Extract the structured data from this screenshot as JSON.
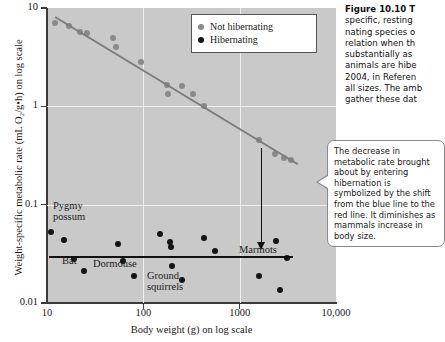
{
  "chart_data": {
    "type": "scatter",
    "title": "",
    "xlabel": "Body weight (g) on log scale",
    "ylabel": "Weight-specific metabolic rate (mL O₂/g•h) on log scale",
    "xscale": "log",
    "yscale": "log",
    "xlim": [
      10,
      10000
    ],
    "ylim": [
      0.01,
      10
    ],
    "xticks": [
      "10",
      "100",
      "1000",
      "10,000"
    ],
    "yticks": [
      "10",
      "1",
      "0.1",
      "0.01"
    ],
    "grid": true,
    "legend_position": "top-right",
    "series": [
      {
        "name": "Not hibernating",
        "color": "#8a8a8a",
        "points": [
          {
            "x": 12,
            "y": 7.0
          },
          {
            "x": 17,
            "y": 6.6
          },
          {
            "x": 22,
            "y": 5.7
          },
          {
            "x": 26,
            "y": 5.6
          },
          {
            "x": 48,
            "y": 5.0
          },
          {
            "x": 52,
            "y": 4.0
          },
          {
            "x": 95,
            "y": 2.8
          },
          {
            "x": 175,
            "y": 1.65
          },
          {
            "x": 180,
            "y": 1.35
          },
          {
            "x": 255,
            "y": 1.6
          },
          {
            "x": 330,
            "y": 1.35
          },
          {
            "x": 430,
            "y": 1.0
          },
          {
            "x": 1600,
            "y": 0.45
          },
          {
            "x": 2300,
            "y": 0.33
          },
          {
            "x": 2900,
            "y": 0.3
          },
          {
            "x": 3400,
            "y": 0.285
          }
        ]
      },
      {
        "name": "Hibernating",
        "color": "#141414",
        "points": [
          {
            "x": 11,
            "y": 0.053
          },
          {
            "x": 15,
            "y": 0.044
          },
          {
            "x": 19,
            "y": 0.028
          },
          {
            "x": 24,
            "y": 0.021
          },
          {
            "x": 55,
            "y": 0.04
          },
          {
            "x": 62,
            "y": 0.027
          },
          {
            "x": 80,
            "y": 0.019
          },
          {
            "x": 150,
            "y": 0.05
          },
          {
            "x": 190,
            "y": 0.042
          },
          {
            "x": 193,
            "y": 0.037
          },
          {
            "x": 200,
            "y": 0.024
          },
          {
            "x": 250,
            "y": 0.017
          },
          {
            "x": 430,
            "y": 0.046
          },
          {
            "x": 560,
            "y": 0.034
          },
          {
            "x": 1600,
            "y": 0.019
          },
          {
            "x": 2400,
            "y": 0.043
          },
          {
            "x": 3100,
            "y": 0.029
          },
          {
            "x": 2600,
            "y": 0.0135
          }
        ]
      }
    ],
    "trendlines": [
      {
        "name": "not-hibernating-regression",
        "color": "#7c7c7c",
        "from": {
          "x": 12,
          "y": 8.2
        },
        "to": {
          "x": 4000,
          "y": 0.26
        }
      },
      {
        "name": "hibernating-regression",
        "color": "#111111",
        "from": {
          "x": 10.5,
          "y": 0.03
        },
        "to": {
          "x": 3600,
          "y": 0.03
        }
      }
    ],
    "annotations": [
      {
        "label": "Pygmy possum",
        "species": "pygmy-possum"
      },
      {
        "label": "Bat",
        "species": "bat"
      },
      {
        "label": "Dormouse",
        "species": "dormouse"
      },
      {
        "label": "Ground squirrels",
        "species": "ground-squirrels"
      },
      {
        "label": "Marmots",
        "species": "marmots"
      }
    ]
  },
  "legend": {
    "items": [
      {
        "label": "Not hibernating",
        "color": "#8a8a8a"
      },
      {
        "label": "Hibernating",
        "color": "#141414"
      }
    ]
  },
  "axis": {
    "y_title": "Weight-specific metabolic rate (mL O₂/g•h) on log scale",
    "x_title": "Body weight (g) on log scale",
    "y_ticks": [
      "10",
      "1",
      "0.1",
      "0.01"
    ],
    "x_ticks": [
      "10",
      "100",
      "1000",
      "10,000"
    ]
  },
  "species_labels": {
    "pygmy_possum_line1": "Pygmy",
    "pygmy_possum_line2": "possum",
    "bat": "Bat",
    "dormouse": "Dormouse",
    "ground_squirrels_line1": "Ground",
    "ground_squirrels_line2": "squirrels",
    "marmots": "Marmots"
  },
  "callout": {
    "text": "The decrease in metabolic rate brought about by entering hibernation is symbolized by the shift from the blue line to the red line. It diminishes as mammals increase in body size."
  },
  "caption": {
    "title": "Figure 10.10  T",
    "lines": [
      "specific, resting ",
      "nating species o",
      "relation when th",
      "substantially as ",
      "animals are hibe",
      "2004, in Referen",
      "all sizes. The amb",
      "gather these dat"
    ]
  }
}
